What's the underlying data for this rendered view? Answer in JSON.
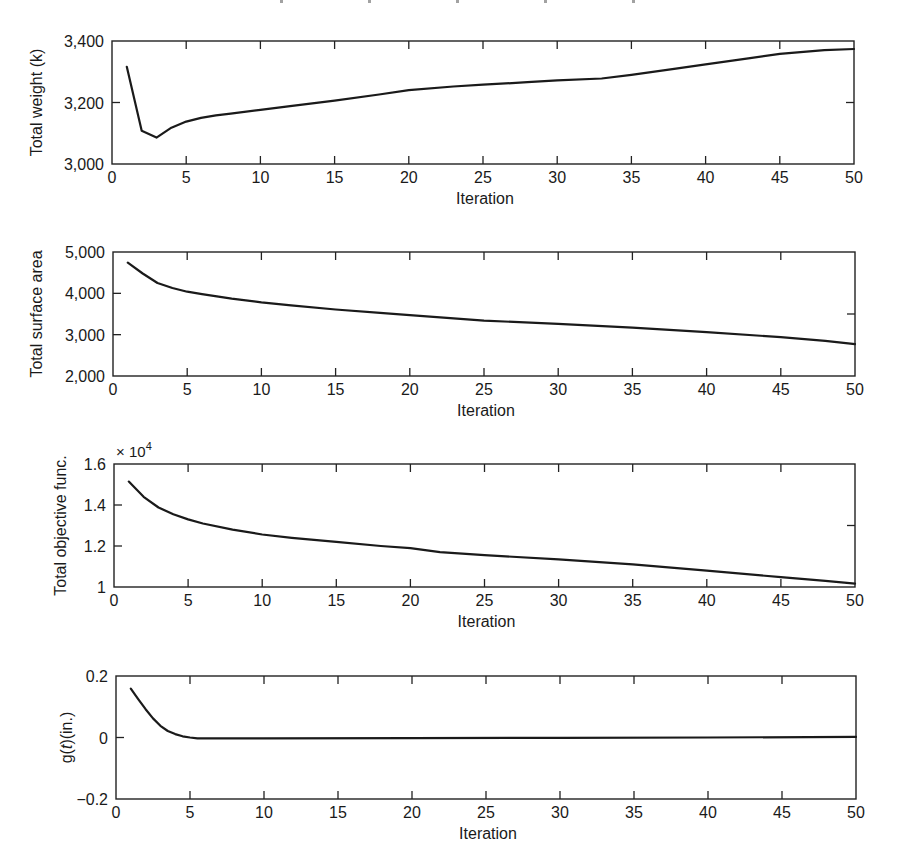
{
  "figure": {
    "clipped_header_note": ""
  },
  "chart_data": [
    {
      "type": "line",
      "title": "",
      "xlabel": "Iteration",
      "ylabel": "Total weight (k)",
      "xlim": [
        0,
        50
      ],
      "ylim": [
        3000,
        3400
      ],
      "xticks": [
        0,
        5,
        10,
        15,
        20,
        25,
        30,
        35,
        40,
        45,
        50
      ],
      "xtick_labels": [
        "0",
        "5",
        "10",
        "15",
        "20",
        "25",
        "30",
        "35",
        "40",
        "45",
        "50"
      ],
      "yticks": [
        3000,
        3200,
        3400
      ],
      "ytick_labels": [
        "3,000",
        "3,200",
        "3,400"
      ],
      "right_ticks": [
        3200
      ],
      "multiplier": "",
      "grid": false,
      "legend": null,
      "series": [
        {
          "name": "Total weight",
          "x": [
            1,
            2,
            3,
            4,
            5,
            6,
            7,
            8,
            10,
            12,
            15,
            18,
            20,
            23,
            25,
            28,
            30,
            33,
            35,
            38,
            40,
            43,
            45,
            48,
            50
          ],
          "y": [
            3316,
            3108,
            3086,
            3118,
            3138,
            3150,
            3158,
            3164,
            3176,
            3188,
            3206,
            3226,
            3240,
            3252,
            3258,
            3266,
            3272,
            3278,
            3290,
            3310,
            3324,
            3344,
            3358,
            3370,
            3374
          ]
        }
      ]
    },
    {
      "type": "line",
      "title": "",
      "xlabel": "Iteration",
      "ylabel": "Total surface area",
      "xlim": [
        0,
        50
      ],
      "ylim": [
        2000,
        5000
      ],
      "xticks": [
        0,
        5,
        10,
        15,
        20,
        25,
        30,
        35,
        40,
        45,
        50
      ],
      "xtick_labels": [
        "0",
        "5",
        "10",
        "15",
        "20",
        "25",
        "30",
        "35",
        "40",
        "45",
        "50"
      ],
      "yticks": [
        2000,
        3000,
        4000,
        5000
      ],
      "ytick_labels": [
        "2,000",
        "3,000",
        "4,000",
        "5,000"
      ],
      "right_ticks": [
        3500
      ],
      "multiplier": "",
      "grid": false,
      "legend": null,
      "series": [
        {
          "name": "Total surface area",
          "x": [
            1,
            2,
            3,
            4,
            5,
            6,
            8,
            10,
            12,
            15,
            18,
            20,
            25,
            30,
            35,
            40,
            45,
            48,
            50
          ],
          "y": [
            4740,
            4480,
            4250,
            4130,
            4040,
            3980,
            3870,
            3780,
            3710,
            3610,
            3530,
            3470,
            3340,
            3260,
            3170,
            3060,
            2940,
            2850,
            2770
          ]
        }
      ]
    },
    {
      "type": "line",
      "title": "",
      "xlabel": "Iteration",
      "ylabel": "Total objective func.",
      "xlim": [
        0,
        50
      ],
      "ylim": [
        1.0,
        1.6
      ],
      "xticks": [
        0,
        5,
        10,
        15,
        20,
        25,
        30,
        35,
        40,
        45,
        50
      ],
      "xtick_labels": [
        "0",
        "5",
        "10",
        "15",
        "20",
        "25",
        "30",
        "35",
        "40",
        "45",
        "50"
      ],
      "yticks": [
        1.0,
        1.2,
        1.4,
        1.6
      ],
      "ytick_labels": [
        "1",
        "1.2",
        "1.4",
        "1.6"
      ],
      "right_ticks": [
        1.3
      ],
      "multiplier": "× 10",
      "multiplier_exp": "4",
      "grid": false,
      "legend": null,
      "series": [
        {
          "name": "Total objective func. (×10^4)",
          "x": [
            1,
            2,
            3,
            4,
            5,
            6,
            8,
            10,
            12,
            15,
            18,
            20,
            22,
            25,
            30,
            35,
            40,
            45,
            48,
            50
          ],
          "y": [
            1.514,
            1.44,
            1.388,
            1.355,
            1.33,
            1.31,
            1.28,
            1.256,
            1.24,
            1.22,
            1.2,
            1.19,
            1.17,
            1.155,
            1.135,
            1.11,
            1.08,
            1.048,
            1.03,
            1.016
          ]
        }
      ]
    },
    {
      "type": "line",
      "title": "",
      "xlabel": "Iteration",
      "ylabel_parts": [
        "g(",
        "t",
        ")(in.)"
      ],
      "ylabel": "g(t)(in.)",
      "xlim": [
        0,
        50
      ],
      "ylim": [
        -0.2,
        0.2
      ],
      "xticks": [
        0,
        5,
        10,
        15,
        20,
        25,
        30,
        35,
        40,
        45,
        50
      ],
      "xtick_labels": [
        "0",
        "5",
        "10",
        "15",
        "20",
        "25",
        "30",
        "35",
        "40",
        "45",
        "50"
      ],
      "yticks": [
        -0.2,
        0,
        0.2
      ],
      "ytick_labels": [
        "−0.2",
        "0",
        "0.2"
      ],
      "right_ticks": [],
      "multiplier": "",
      "grid": false,
      "legend": null,
      "series": [
        {
          "name": "g(t)",
          "x": [
            1,
            1.5,
            2,
            2.5,
            3,
            3.5,
            4,
            4.5,
            5,
            5.5,
            6,
            10,
            20,
            30,
            40,
            50
          ],
          "y": [
            0.159,
            0.125,
            0.092,
            0.062,
            0.038,
            0.021,
            0.011,
            0.004,
            0.0,
            -0.003,
            -0.003,
            -0.003,
            -0.002,
            -0.001,
            0.0,
            0.002
          ]
        }
      ]
    }
  ]
}
